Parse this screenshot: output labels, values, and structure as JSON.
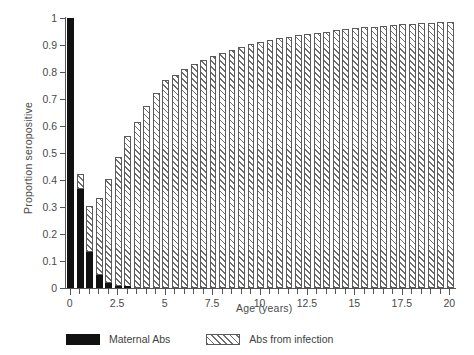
{
  "chart_data": {
    "type": "bar",
    "title": "",
    "xlabel": "Age (years)",
    "ylabel": "Proportion seropositive",
    "xlim": [
      -0.25,
      20.25
    ],
    "ylim": [
      0,
      1
    ],
    "grid": false,
    "stacked": true,
    "legend_position": "bottom",
    "ytick_labels": [
      "0",
      "0.1",
      "0.2",
      "0.3",
      "0.4",
      "0.5",
      "0.6",
      "0.7",
      "0.8",
      "0.9",
      "1"
    ],
    "ytick_values": [
      0,
      0.1,
      0.2,
      0.3,
      0.4,
      0.5,
      0.6,
      0.7,
      0.8,
      0.9,
      1
    ],
    "xtick_labels": [
      "0",
      "2.5",
      "5",
      "7.5",
      "10",
      "12.5",
      "15",
      "17.5",
      "20"
    ],
    "xtick_values": [
      0,
      2.5,
      5,
      7.5,
      10,
      12.5,
      15,
      17.5,
      20
    ],
    "xtick_minor_step": 0.5,
    "x": [
      0,
      0.5,
      1,
      1.5,
      2,
      2.5,
      3,
      3.5,
      4,
      4.5,
      5,
      5.5,
      6,
      6.5,
      7,
      7.5,
      8,
      8.5,
      9,
      9.5,
      10,
      10.5,
      11,
      11.5,
      12,
      12.5,
      13,
      13.5,
      14,
      14.5,
      15,
      15.5,
      16,
      16.5,
      17,
      17.5,
      18,
      18.5,
      19,
      19.5,
      20
    ],
    "series": [
      {
        "name": "Maternal Abs",
        "color": "#111111",
        "pattern": "solid",
        "values": [
          1.0,
          0.365,
          0.135,
          0.05,
          0.018,
          0.006,
          0.002,
          0,
          0,
          0,
          0,
          0,
          0,
          0,
          0,
          0,
          0,
          0,
          0,
          0,
          0,
          0,
          0,
          0,
          0,
          0,
          0,
          0,
          0,
          0,
          0,
          0,
          0,
          0,
          0,
          0,
          0,
          0,
          0,
          0,
          0
        ]
      },
      {
        "name": "Abs from infection",
        "color": "#ffffff",
        "pattern": "diagonal-hatch",
        "values": [
          0.0,
          0.055,
          0.165,
          0.28,
          0.382,
          0.474,
          0.558,
          0.616,
          0.673,
          0.724,
          0.77,
          0.788,
          0.81,
          0.828,
          0.845,
          0.861,
          0.872,
          0.883,
          0.893,
          0.903,
          0.912,
          0.919,
          0.926,
          0.931,
          0.936,
          0.941,
          0.945,
          0.95,
          0.954,
          0.958,
          0.962,
          0.965,
          0.968,
          0.971,
          0.974,
          0.977,
          0.979,
          0.981,
          0.983,
          0.985,
          0.987
        ]
      }
    ],
    "totals": [
      1.0,
      0.42,
      0.3,
      0.33,
      0.4,
      0.48,
      0.56,
      0.616,
      0.673,
      0.724,
      0.77,
      0.788,
      0.81,
      0.828,
      0.845,
      0.861,
      0.872,
      0.883,
      0.893,
      0.903,
      0.912,
      0.919,
      0.926,
      0.931,
      0.936,
      0.941,
      0.945,
      0.95,
      0.954,
      0.958,
      0.962,
      0.965,
      0.968,
      0.971,
      0.974,
      0.977,
      0.979,
      0.981,
      0.983,
      0.985,
      0.987
    ]
  },
  "legend": {
    "items": [
      {
        "label": "Maternal Abs",
        "swatch": "solid-black"
      },
      {
        "label": "Abs from infection",
        "swatch": "diagonal-hatch"
      }
    ]
  }
}
